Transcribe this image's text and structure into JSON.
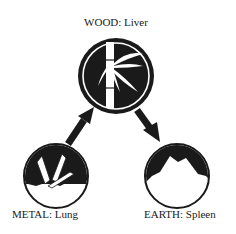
{
  "diagram": {
    "type": "five-elements-cycle",
    "nodes": [
      {
        "id": "wood",
        "element": "WOOD",
        "organ": "Liver",
        "label": "WOOD: Liver",
        "icon": "bamboo-icon"
      },
      {
        "id": "metal",
        "element": "METAL",
        "organ": "Lung",
        "label": "METAL: Lung",
        "icon": "crystal-icon"
      },
      {
        "id": "earth",
        "element": "EARTH",
        "organ": "Spleen",
        "label": "EARTH: Spleen",
        "icon": "mountain-icon"
      }
    ],
    "edges": [
      {
        "from": "metal",
        "to": "wood"
      },
      {
        "from": "wood",
        "to": "earth"
      }
    ],
    "colors": {
      "ink": "#1a1a1a",
      "background": "#ffffff"
    }
  }
}
